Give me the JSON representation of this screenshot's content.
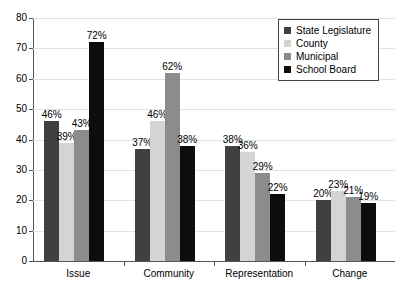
{
  "chart_data": {
    "type": "bar",
    "title": "",
    "xlabel": "",
    "ylabel": "",
    "ylim": [
      0,
      80
    ],
    "yticks": [
      0,
      10,
      20,
      30,
      40,
      50,
      60,
      70,
      80
    ],
    "grid": true,
    "legend_position": "top-right",
    "categories": [
      "Issue",
      "Community",
      "Representation",
      "Change"
    ],
    "series": [
      {
        "name": "State Legislature",
        "color": "#404040",
        "values": [
          46,
          37,
          38,
          20
        ],
        "labels": [
          "46%",
          "37%",
          "38%",
          "20%"
        ]
      },
      {
        "name": "County",
        "color": "#d4d4d4",
        "values": [
          39,
          46,
          36,
          23
        ],
        "labels": [
          "39%",
          "46%",
          "36%",
          "23%"
        ]
      },
      {
        "name": "Municipal",
        "color": "#8c8c8c",
        "values": [
          43,
          62,
          29,
          21
        ],
        "labels": [
          "43%",
          "62%",
          "29%",
          "21%"
        ]
      },
      {
        "name": "School Board",
        "color": "#0d0d0d",
        "values": [
          72,
          38,
          22,
          19
        ],
        "labels": [
          "72%",
          "38%",
          "22%",
          "19%"
        ]
      }
    ]
  },
  "axis": {
    "tick_labels": [
      "0",
      "10",
      "20",
      "30",
      "40",
      "50",
      "60",
      "70",
      "80"
    ]
  },
  "legend": {
    "items": [
      {
        "label": "State Legislature",
        "color": "#404040"
      },
      {
        "label": "County",
        "color": "#d4d4d4"
      },
      {
        "label": "Municipal",
        "color": "#8c8c8c"
      },
      {
        "label": "School Board",
        "color": "#0d0d0d"
      }
    ]
  },
  "colors": {
    "axis": "#555555",
    "grid": "#e2e2e2",
    "text": "#000000",
    "background": "#ffffff"
  }
}
